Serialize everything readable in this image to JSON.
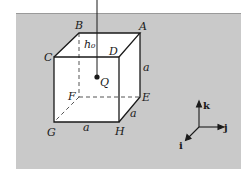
{
  "figure": {
    "type": "cube-diagram",
    "background_color": "#c9c9c9",
    "face_color": "#ffffff",
    "line_color": "#1a1a1a",
    "vertices": {
      "A": "A",
      "B": "B",
      "C": "C",
      "D": "D",
      "E": "E",
      "F": "F",
      "G": "G",
      "H": "H"
    },
    "point": {
      "label": "Q"
    },
    "height_label": "h₀",
    "edge_labels": {
      "vertical": "a",
      "depth": "a",
      "bottom": "a"
    },
    "axes": {
      "k": "k",
      "j": "j",
      "i": "i"
    }
  }
}
